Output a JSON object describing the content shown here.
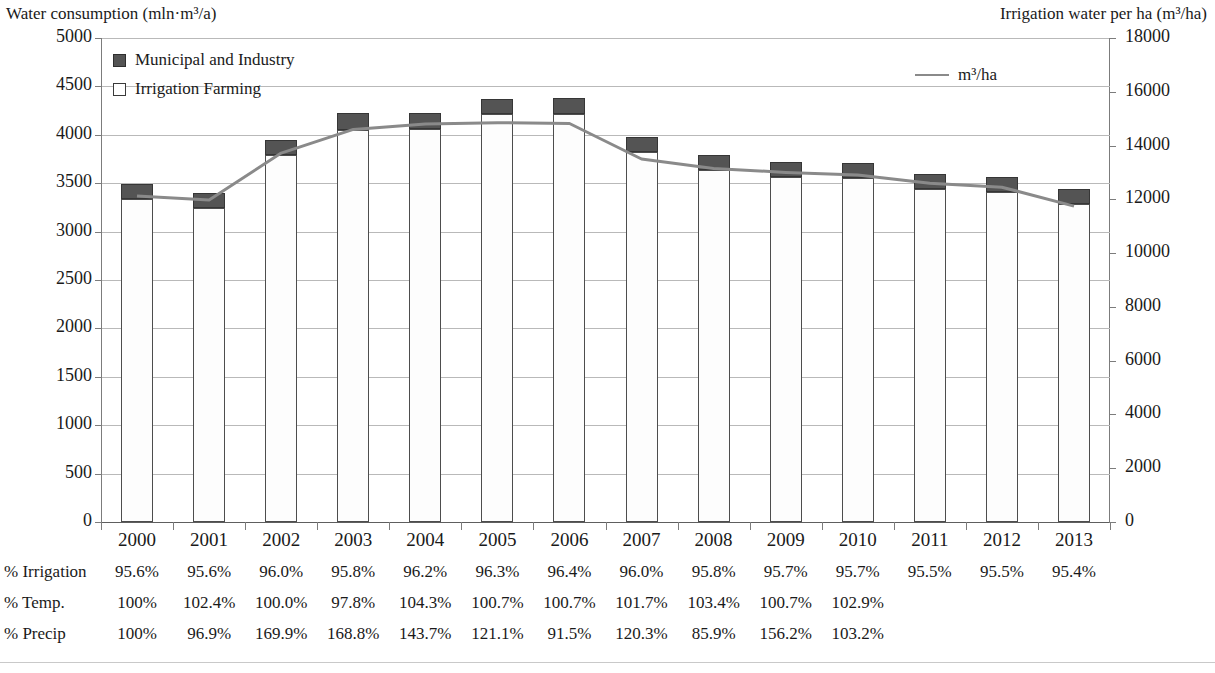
{
  "axes": {
    "left_title": "Water consumption (mln·m³/a)",
    "right_title": "Irrigation water per ha (m³/ha)",
    "left_ticks": [
      "5000",
      "4500",
      "4000",
      "3500",
      "3000",
      "2500",
      "2000",
      "1500",
      "1000",
      "500",
      "0"
    ],
    "right_ticks": [
      "18000",
      "16000",
      "14000",
      "12000",
      "10000",
      "8000",
      "6000",
      "4000",
      "2000",
      "0"
    ]
  },
  "legend": {
    "municipal": "Municipal and Industry",
    "irrigation": "Irrigation Farming",
    "line": "m³/ha"
  },
  "table": {
    "row_labels": [
      "% Irrigation",
      "% Temp.",
      "% Precip"
    ],
    "irrigation": [
      "95.6%",
      "95.6%",
      "96.0%",
      "95.8%",
      "96.2%",
      "96.3%",
      "96.4%",
      "96.0%",
      "95.8%",
      "95.7%",
      "95.7%",
      "95.5%",
      "95.5%",
      "95.4%"
    ],
    "temp": [
      "100%",
      "102.4%",
      "100.0%",
      "97.8%",
      "104.3%",
      "100.7%",
      "100.7%",
      "101.7%",
      "103.4%",
      "100.7%",
      "102.9%",
      "",
      "",
      ""
    ],
    "precip": [
      "100%",
      "96.9%",
      "169.9%",
      "168.8%",
      "143.7%",
      "121.1%",
      "91.5%",
      "120.3%",
      "85.9%",
      "156.2%",
      "103.2%",
      "",
      "",
      ""
    ]
  },
  "colors": {
    "municipal_fill": "#545454",
    "irrigation_fill": "#fdfdfd",
    "line": "#8a8a8a",
    "gridline": "#b9b9b9",
    "axis": "#7c7c7c"
  },
  "chart_data": {
    "type": "bar",
    "title": "",
    "subtitle": "",
    "xlabel": "",
    "ylabel": "Water consumption (mln·m³/a)",
    "y2label": "Irrigation water per ha (m³/ha)",
    "ylim": [
      0,
      5000
    ],
    "y2lim": [
      0,
      18000
    ],
    "ytick_step": 500,
    "y2tick_step": 2000,
    "grid": true,
    "legend_position": "inside-top-left-and-top-right",
    "stacked": true,
    "categories": [
      "2000",
      "2001",
      "2002",
      "2003",
      "2004",
      "2005",
      "2006",
      "2007",
      "2008",
      "2009",
      "2010",
      "2011",
      "2012",
      "2013"
    ],
    "series": [
      {
        "name": "Irrigation Farming",
        "axis": "left",
        "type": "bar",
        "values": [
          3337,
          3246,
          3787,
          4049,
          4065,
          4213,
          4219,
          3823,
          3634,
          3562,
          3550,
          3436,
          3408,
          3282
        ]
      },
      {
        "name": "Municipal and Industry",
        "axis": "left",
        "type": "bar",
        "values": [
          154,
          149,
          158,
          178,
          161,
          162,
          158,
          159,
          160,
          160,
          160,
          162,
          161,
          155
        ]
      },
      {
        "name": "m³/ha",
        "axis": "right",
        "type": "line",
        "values": [
          12120,
          11980,
          13720,
          14600,
          14800,
          14850,
          14820,
          13500,
          13150,
          13000,
          12900,
          12600,
          12450,
          11750
        ]
      }
    ],
    "annotations_table": {
      "% Irrigation": [
        "95.6%",
        "95.6%",
        "96.0%",
        "95.8%",
        "96.2%",
        "96.3%",
        "96.4%",
        "96.0%",
        "95.8%",
        "95.7%",
        "95.7%",
        "95.5%",
        "95.5%",
        "95.4%"
      ],
      "% Temp.": [
        "100%",
        "102.4%",
        "100.0%",
        "97.8%",
        "104.3%",
        "100.7%",
        "100.7%",
        "101.7%",
        "103.4%",
        "100.7%",
        "102.9%",
        null,
        null,
        null
      ],
      "% Precip": [
        "100%",
        "96.9%",
        "169.9%",
        "168.8%",
        "143.7%",
        "121.1%",
        "91.5%",
        "120.3%",
        "85.9%",
        "156.2%",
        "103.2%",
        null,
        null,
        null
      ]
    }
  }
}
